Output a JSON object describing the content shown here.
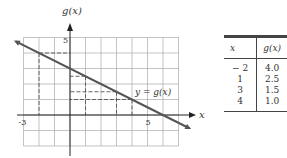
{
  "chart_data": {
    "type": "line",
    "title": "",
    "xlabel": "x",
    "ylabel": "g(x)",
    "xlim": [
      -3,
      7
    ],
    "ylim": [
      -2,
      5
    ],
    "grid": true,
    "x_tick_labels": [
      "-3",
      "5"
    ],
    "y_tick_labels": [
      "5"
    ],
    "series": [
      {
        "name": "y = g(x)",
        "x": [
          -3.5,
          7.7
        ],
        "y": [
          4.75,
          -0.85
        ]
      }
    ],
    "highlighted_points": [
      {
        "x": -2,
        "y": 4.0
      },
      {
        "x": 1,
        "y": 2.5
      },
      {
        "x": 3,
        "y": 1.5
      },
      {
        "x": 4,
        "y": 1.0
      }
    ],
    "annotation": "y = g(x)",
    "table": {
      "headers": [
        "x",
        "g(x)"
      ],
      "rows": [
        [
          "− 2",
          "4.0"
        ],
        [
          "1",
          "2.5"
        ],
        [
          "3",
          "1.5"
        ],
        [
          "4",
          "1.0"
        ]
      ]
    },
    "colors": {
      "line": "#555555",
      "grid": "#aaaaaa",
      "dash": "#555555"
    }
  }
}
